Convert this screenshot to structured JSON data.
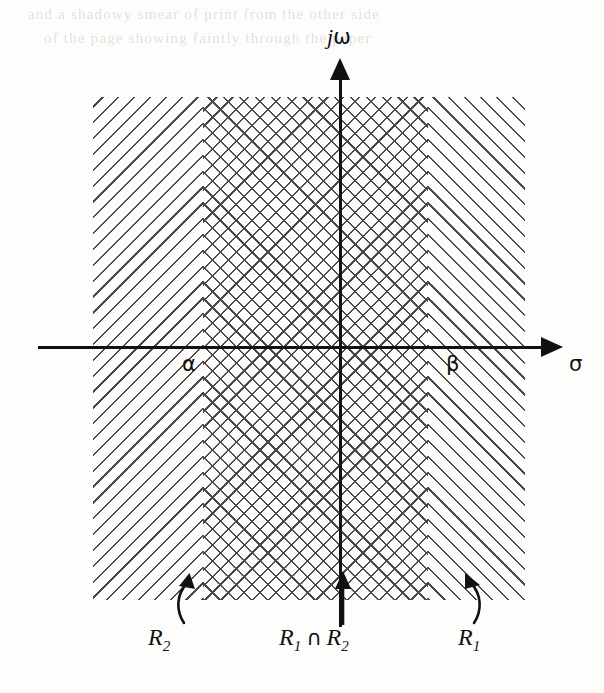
{
  "figure": {
    "type": "s-plane-roc-diagram",
    "axes": {
      "vertical": {
        "label_italic": "j",
        "label_upright": "ω",
        "name": "jω"
      },
      "horizontal": {
        "label": "σ",
        "name": "sigma"
      }
    },
    "points": [
      {
        "id": "alpha",
        "label": "α",
        "axis": "sigma"
      },
      {
        "id": "beta",
        "label": "β",
        "axis": "sigma"
      }
    ],
    "regions": [
      {
        "id": "r2",
        "label_base": "R",
        "label_sub": "2",
        "hatch": "back-slash",
        "description": "single diagonal hatching, left region"
      },
      {
        "id": "r1_inter_r2",
        "label_base": "R",
        "label_sub": "1",
        "label_operator": "∩",
        "label_base2": "R",
        "label_sub2": "2",
        "hatch": "cross",
        "description": "cross hatched overlap region between alpha and beta"
      },
      {
        "id": "r1",
        "label_base": "R",
        "label_sub": "1",
        "hatch": "forward-slash",
        "description": "single diagonal hatching, right region"
      }
    ],
    "colors": {
      "ink": "#111111",
      "hatch": "#4a4a4a",
      "paper": "#fdfdfb"
    }
  },
  "bleed_text": {
    "line1": "and a shadowy smear of print from the other side",
    "line2": "of the page showing faintly through the paper"
  }
}
